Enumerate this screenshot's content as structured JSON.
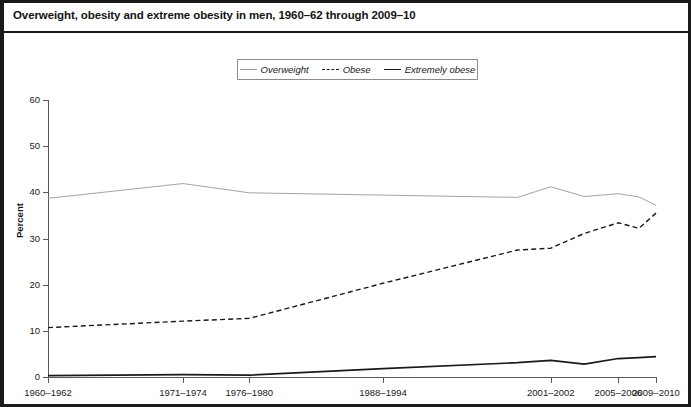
{
  "title": "Overweight, obesity and extreme obesity in men, 1960–62 through 2009–10",
  "legend": {
    "items": [
      {
        "label": "Overweight",
        "style": "solid-thin",
        "color": "#9a9a9a"
      },
      {
        "label": "Obese",
        "style": "dashed",
        "color": "#1a1a1a"
      },
      {
        "label": "Extremely obese",
        "style": "solid-thick",
        "color": "#1a1a1a"
      }
    ]
  },
  "axes": {
    "ylabel": "Percent",
    "yticks": [
      "0",
      "10",
      "20",
      "30",
      "40",
      "50",
      "60"
    ],
    "xticks": [
      "1960–1962",
      "1971–1974",
      "1976–1980",
      "1988–1994",
      "2001–2002",
      "2005–2006",
      "2009–2010"
    ]
  },
  "chart_data": {
    "type": "line",
    "title": "Overweight, obesity and extreme obesity in men, 1960–62 through 2009–10",
    "xlabel": "",
    "ylabel": "Percent",
    "ylim": [
      0,
      60
    ],
    "grid": false,
    "legend_position": "top-center",
    "categories": [
      "1960-1962",
      "1971-1974",
      "1976-1980",
      "1988-1994",
      "1999-2000",
      "2001-2002",
      "2003-2004",
      "2005-2006",
      "2007-2008",
      "2009-2010"
    ],
    "x_positions": [
      0.0,
      0.222,
      0.331,
      0.551,
      0.772,
      0.827,
      0.882,
      0.938,
      0.972,
      1.0
    ],
    "series": [
      {
        "name": "Overweight",
        "style": "solid-thin",
        "color": "#9a9a9a",
        "values": [
          38.7,
          41.9,
          39.9,
          39.4,
          38.9,
          41.2,
          39.1,
          39.7,
          39.0,
          37.2
        ]
      },
      {
        "name": "Obese",
        "style": "dashed",
        "color": "#1a1a1a",
        "values": [
          10.7,
          12.1,
          12.7,
          20.3,
          27.5,
          27.9,
          31.1,
          33.4,
          32.2,
          35.5
        ]
      },
      {
        "name": "Extremely obese",
        "style": "solid-thick",
        "color": "#1a1a1a",
        "values": [
          0.3,
          0.5,
          0.4,
          1.8,
          3.1,
          3.6,
          2.8,
          4.0,
          4.2,
          4.4
        ]
      }
    ]
  }
}
